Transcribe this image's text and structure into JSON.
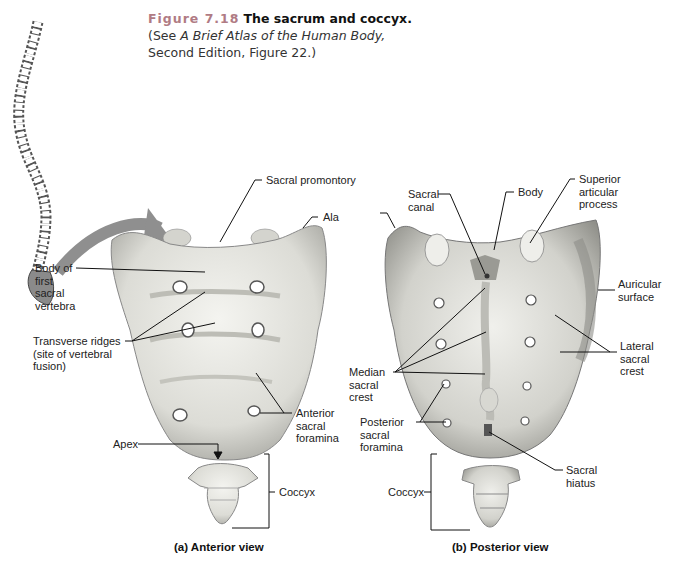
{
  "figure": {
    "number": "Figure 7.18",
    "title": "The sacrum and coccyx.",
    "reference_prefix": "(See ",
    "reference_book": "A Brief Atlas of the Human Body,",
    "reference_suffix": "Second Edition, Figure 22.)"
  },
  "anterior_view": {
    "caption": "(a) Anterior view",
    "labels": {
      "sacral_promontory": "Sacral promontory",
      "ala": "Ala",
      "body_first_sacral": "Body of\nfirst\nsacral\nvertebra",
      "transverse_ridges": "Transverse ridges\n(site of vertebral\nfusion)",
      "anterior_foramina": "Anterior\nsacral\nforamina",
      "apex": "Apex",
      "coccyx": "Coccyx"
    }
  },
  "posterior_view": {
    "caption": "(b)  Posterior view",
    "labels": {
      "sacral_canal": "Sacral\ncanal",
      "body": "Body",
      "superior_articular": "Superior\narticular\nprocess",
      "auricular_surface": "Auricular\nsurface",
      "lateral_sacral_crest": "Lateral\nsacral\ncrest",
      "median_sacral_crest": "Median\nsacral\ncrest",
      "posterior_foramina": "Posterior\nsacral\nforamina",
      "sacral_hiatus": "Sacral\nhiatus",
      "coccyx": "Coccyx"
    }
  },
  "colors": {
    "figure_number": "#b07b84",
    "arrow": "#8f8f8f",
    "bone_fill": "#e6e6e0",
    "bone_shadow": "#a8a8a2"
  }
}
